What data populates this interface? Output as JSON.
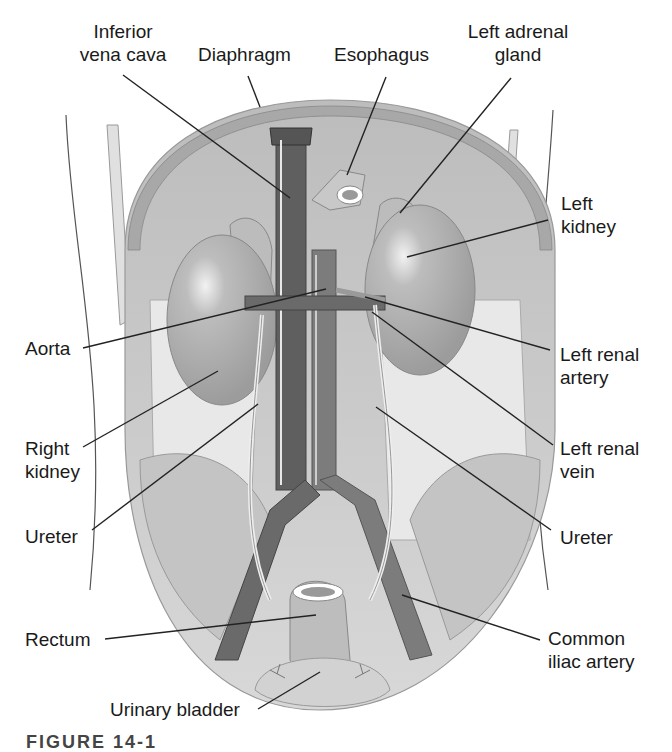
{
  "figure": {
    "caption_partial": "FIGURE 14-1",
    "labels": {
      "inferior_vena_cava": "Inferior\nvena cava",
      "diaphragm": "Diaphragm",
      "esophagus": "Esophagus",
      "left_adrenal_gland": "Left adrenal\ngland",
      "left_kidney": "Left\nkidney",
      "aorta": "Aorta",
      "left_renal_artery": "Left renal\nartery",
      "right_kidney": "Right\nkidney",
      "left_renal_vein": "Left renal\nvein",
      "ureter_right": "Ureter",
      "ureter_left": "Ureter",
      "rectum": "Rectum",
      "common_iliac_artery": "Common\niliac artery",
      "urinary_bladder": "Urinary bladder"
    },
    "colors": {
      "background": "#ffffff",
      "diaphragm": "#b8b8b8",
      "cavity": "#d4d4d4",
      "kidney": "#a9a9a9",
      "vena_cava": "#5f5f5f",
      "aorta": "#7c7c7c",
      "muscle": "#e4e4e4",
      "leader_line": "#222222",
      "label_text": "#1a1a1a"
    }
  }
}
